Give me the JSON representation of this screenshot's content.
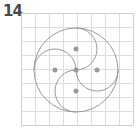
{
  "figure": {
    "number_label": "14",
    "grid": {
      "x0": 21,
      "y0": 13,
      "cell": 14,
      "cols": 8,
      "rows": 8,
      "color": "#dddddd",
      "border_color": "#cfcfcf"
    },
    "outer_circle": {
      "cx": 76,
      "cy": 70,
      "r": 42,
      "color": "#9a9a9a"
    },
    "arcs": [
      {
        "name": "top",
        "from": [
          76,
          28
        ],
        "to": [
          76,
          70
        ],
        "r": 21
      },
      {
        "name": "left",
        "from": [
          34,
          70
        ],
        "to": [
          76,
          70
        ],
        "r": 21
      },
      {
        "name": "right",
        "from": [
          118,
          70
        ],
        "to": [
          76,
          70
        ],
        "r": 21
      },
      {
        "name": "bottom",
        "from": [
          76,
          112
        ],
        "to": [
          76,
          70
        ],
        "r": 21
      }
    ],
    "dots": [
      {
        "name": "top",
        "cx": 76,
        "cy": 49
      },
      {
        "name": "left",
        "cx": 55,
        "cy": 70
      },
      {
        "name": "center",
        "cx": 76,
        "cy": 70
      },
      {
        "name": "right",
        "cx": 97,
        "cy": 70
      },
      {
        "name": "bottom",
        "cx": 76,
        "cy": 91
      }
    ],
    "dot_color": "#9a9a9a"
  }
}
